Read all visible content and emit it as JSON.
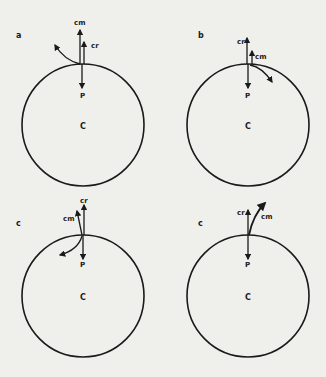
{
  "colors": {
    "background": "#efefec",
    "ink": "#1a1a1a"
  },
  "panels": [
    {
      "id": "a",
      "panel_label": "a",
      "center_label": "C",
      "point_label": "P",
      "cr_label": "cr",
      "cm_label": "cm",
      "description": "cm arrow vertical above cr; curved arrow sweeping up-left"
    },
    {
      "id": "b",
      "panel_label": "b",
      "center_label": "C",
      "point_label": "P",
      "cr_label": "cr",
      "cm_label": "cm",
      "description": "cr arrow tall; short cm arrow; curved arrow sweeping down-right along circle"
    },
    {
      "id": "c1",
      "panel_label": "c",
      "center_label": "C",
      "point_label": "P",
      "cr_label": "cr",
      "cm_label": "cm",
      "description": "cm arrow tilted left of cr; curved arrow sweeping down-left inside circle"
    },
    {
      "id": "c2",
      "panel_label": "c",
      "center_label": "C",
      "point_label": "P",
      "cr_label": "cr",
      "cm_label": "cm",
      "description": "cm arrow tilted right of cr, curved up-right"
    }
  ]
}
